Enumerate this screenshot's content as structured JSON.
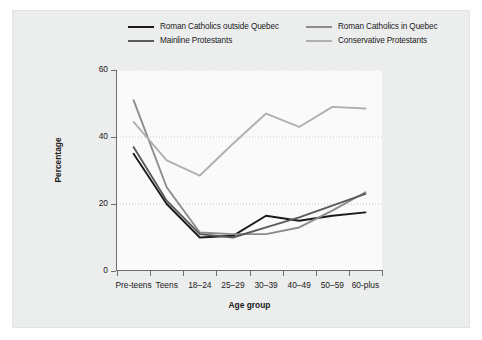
{
  "chart_data": {
    "type": "line",
    "title": "",
    "xlabel": "Age group",
    "ylabel": "Percentage",
    "categories": [
      "Pre-teens",
      "Teens",
      "18–24",
      "25–29",
      "30–39",
      "40–49",
      "50–59",
      "60-plus"
    ],
    "ylim": [
      0,
      60
    ],
    "yticks": [
      0,
      20,
      40,
      60
    ],
    "grid": true,
    "grid_style": "dotted-horizontal",
    "legend_position": "top",
    "series": [
      {
        "name": "Roman Catholics outside Quebec",
        "color": "#1a1a1a",
        "values": [
          35,
          20,
          10,
          10.5,
          16.5,
          15,
          16.5,
          17.5
        ]
      },
      {
        "name": "Roman Catholics in Quebec",
        "color": "#8c8c8c",
        "values": [
          51,
          25,
          11.5,
          11,
          11,
          13,
          18,
          23.5
        ]
      },
      {
        "name": "Mainline Protestants",
        "color": "#5a5a5a",
        "values": [
          37,
          21,
          11,
          10,
          13,
          16,
          19.5,
          23
        ]
      },
      {
        "name": "Conservative Protestants",
        "color": "#b0b0b0",
        "values": [
          44.5,
          33,
          28.5,
          38,
          47,
          43,
          49,
          48.5
        ]
      }
    ]
  },
  "legend": {
    "items": [
      {
        "label": "Roman Catholics outside Quebec",
        "color": "#1a1a1a"
      },
      {
        "label": "Roman Catholics in Quebec",
        "color": "#8c8c8c"
      },
      {
        "label": "Mainline Protestants",
        "color": "#5a5a5a"
      },
      {
        "label": "Conservative Protestants",
        "color": "#b0b0b0"
      }
    ]
  },
  "axes": {
    "y_title": "Percentage",
    "x_title": "Age group",
    "y_tick_labels": [
      "0",
      "20",
      "40",
      "60"
    ],
    "x_tick_labels": [
      "Pre-teens",
      "Teens",
      "18–24",
      "25–29",
      "30–39",
      "40–49",
      "50–59",
      "60-plus"
    ]
  }
}
